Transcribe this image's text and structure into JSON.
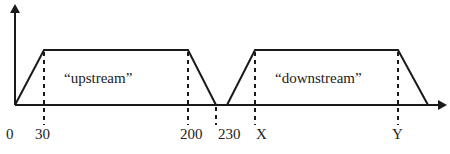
{
  "diagram": {
    "type": "trapezoid-timeline",
    "axes": {
      "y_axis": {
        "arrow": true
      },
      "x_axis": {
        "arrow": true
      }
    },
    "regions": [
      {
        "label": "“upstream”",
        "start": "0",
        "ramp_up_end": "30",
        "ramp_down_start": "200",
        "end": "230"
      },
      {
        "label": "“downstream”",
        "ramp_up_end": "X",
        "ramp_down_start": "Y"
      }
    ],
    "tick_labels": [
      "0",
      "30",
      "200",
      "230",
      "X",
      "Y"
    ],
    "colors": {
      "line": "#1a1a1a",
      "text": "#222222",
      "background": "#ffffff"
    }
  }
}
